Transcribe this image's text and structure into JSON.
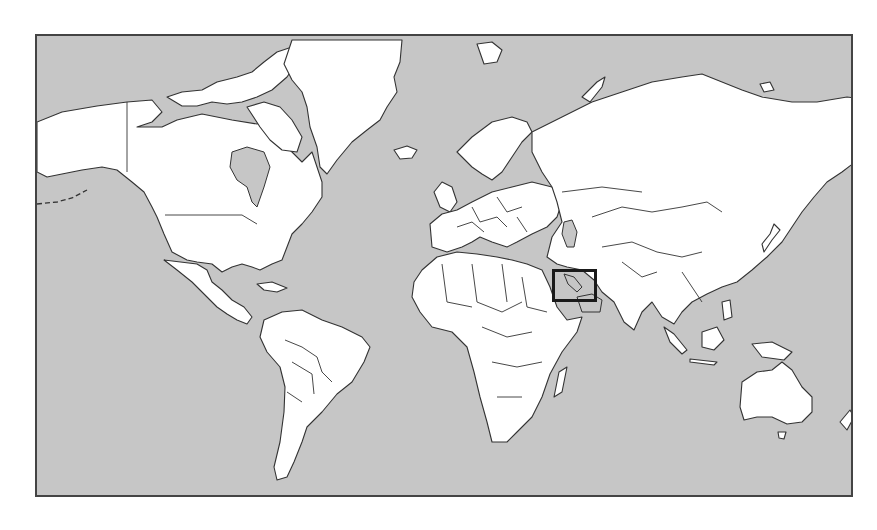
{
  "map": {
    "projection": "Mercator",
    "style": "grayscale world political outline map",
    "colors": {
      "ocean": "#c6c6c6",
      "land": "#ffffff",
      "outline": "#333333",
      "highlight_box": "#1a1a1a"
    },
    "highlight": {
      "region": "Arabian Peninsula / Persian Gulf / Oman",
      "box": {
        "left": 550,
        "top": 267,
        "width": 45,
        "height": 33
      }
    }
  }
}
